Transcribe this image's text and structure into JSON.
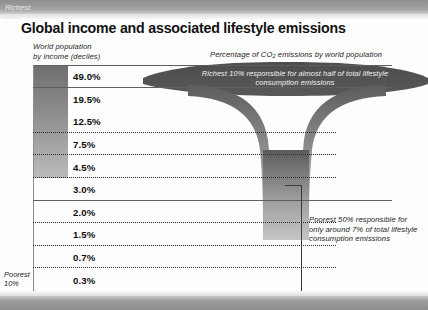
{
  "title": "Global income and associated lifestyle emissions",
  "axis": {
    "left_caption_line1": "World population",
    "left_caption_line2": "by income (deciles)",
    "right_caption_pre": "Percentage of  CO",
    "right_caption_sub": "2",
    "right_caption_post": " emissions by world population"
  },
  "labels": {
    "richest": "Richest\n10%",
    "poorest": "Poorest\n10%"
  },
  "annotations": {
    "top": "Richest 10% responsible for almost half of total lifestyle consumption emissions",
    "bottom": "Poorest 50% responsible for only around 7% of total lifestyle consumption emissions"
  },
  "colors": {
    "funnel_dark": "#4a4a4a",
    "funnel_mid": "#9b9b9b",
    "band_grey": "#9a9a9a",
    "text": "#111111"
  },
  "chart_data": {
    "type": "bar",
    "title": "Global income and associated lifestyle emissions",
    "xlabel": "Percentage of CO2 emissions by world population",
    "ylabel": "World population by income (deciles)",
    "categories": [
      "Richest 10%",
      "Decile 2",
      "Decile 3",
      "Decile 4",
      "Decile 5",
      "Decile 6",
      "Decile 7",
      "Decile 8",
      "Decile 9",
      "Poorest 10%"
    ],
    "values": [
      49.0,
      19.5,
      12.5,
      7.5,
      4.5,
      3.0,
      2.0,
      1.5,
      0.7,
      0.3
    ],
    "value_labels": [
      "49.0%",
      "19.5%",
      "12.5%",
      "7.5%",
      "4.5%",
      "3.0%",
      "2.0%",
      "1.5%",
      "0.7%",
      "0.3%"
    ],
    "unit": "%",
    "grid": true,
    "legend": "none",
    "notes": [
      "Richest 10% responsible for almost half of total lifestyle consumption emissions",
      "Poorest 50% responsible for only around 7% of total lifestyle consumption emissions"
    ]
  }
}
